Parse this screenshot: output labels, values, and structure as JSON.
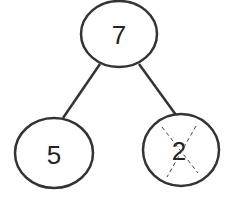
{
  "diagram": {
    "type": "number-bond",
    "whole": "7",
    "parts": [
      {
        "value": "5",
        "crossed_out": false
      },
      {
        "value": "2",
        "crossed_out": true
      }
    ],
    "stroke_color": "#333333"
  }
}
